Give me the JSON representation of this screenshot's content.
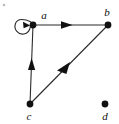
{
  "figure": {
    "kind": "directed-graph",
    "background_color": "#ffffff",
    "ink_color": "#111111",
    "edge_color": "#2b2b2b",
    "width": 119,
    "height": 124
  },
  "nodes": [
    {
      "id": "a",
      "label": "a",
      "x": 33,
      "y": 25,
      "r": 3.4,
      "label_x": 44,
      "label_y": 19
    },
    {
      "id": "b",
      "label": "b",
      "x": 108,
      "y": 25,
      "r": 3.4,
      "label_x": 107,
      "label_y": 16
    },
    {
      "id": "c",
      "label": "c",
      "x": 30,
      "y": 104,
      "r": 3.4,
      "label_x": 29,
      "label_y": 120
    },
    {
      "id": "d",
      "label": "d",
      "x": 105,
      "y": 104,
      "r": 3.4,
      "label_x": 105,
      "label_y": 120
    }
  ],
  "edges": [
    {
      "id": "a-a",
      "from": "a",
      "to": "a",
      "kind": "self-loop",
      "direction": "loop"
    },
    {
      "id": "a-b",
      "from": "a",
      "to": "b",
      "kind": "straight",
      "direction": "right"
    },
    {
      "id": "c-a",
      "from": "c",
      "to": "a",
      "kind": "straight",
      "direction": "up"
    },
    {
      "id": "b-c",
      "from": "b",
      "to": "c",
      "kind": "straight",
      "direction": "down-left"
    }
  ],
  "artifacts": [
    {
      "id": "speck-top-left",
      "x": 4,
      "y": 5
    }
  ]
}
